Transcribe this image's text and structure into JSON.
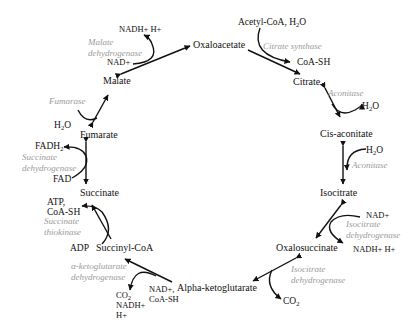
{
  "metabolites": {
    "oxaloacetate": "Oxaloacetate",
    "citrate": "Citrate",
    "cis_aconitate": "Cis-aconitate",
    "isocitrate": "Isocitrate",
    "oxalosuccinate": "Oxalosuccinate",
    "alpha_ketoglutarate": "Alpha-ketoglutarate",
    "succinyl_coa": "Succinyl-CoA",
    "succinate": "Succinate",
    "fumarate": "Fumarate",
    "malate": "Malate"
  },
  "enzymes": {
    "citrate_synthase": "Citrate synthase",
    "aconitase_1": "Aconitase",
    "aconitase_2": "Aconitase",
    "isocitrate_dh_1": [
      "Isocitrate",
      "dehydrogenase"
    ],
    "isocitrate_dh_2": [
      "Isocitrate",
      "dehydrogenase"
    ],
    "akg_dh": [
      "α-ketoglutarate",
      "dehydrogenase"
    ],
    "succinate_thiokinase": [
      "Succinate",
      "thiokinase"
    ],
    "succinate_dh": [
      "Succinate",
      "dehydrogenase"
    ],
    "fumarase": "Fumarase",
    "malate_dh": [
      "Malate",
      "dehydrogenase"
    ]
  },
  "cofactors": {
    "acetyl_coa_h2o": {
      "text": "Acetyl-CoA, H",
      "sub": "2",
      "tail": "O"
    },
    "coa_sh_citrate": "CoA-SH",
    "h2o_aconitase_out": {
      "text": "H",
      "sub": "2",
      "tail": "O"
    },
    "h2o_aconitase_in": {
      "text": "H",
      "sub": "2",
      "tail": "O"
    },
    "nad_isocitrate": "NAD+",
    "nadh_isocitrate": "NADH+ H+",
    "co2_oxalosuccinate": {
      "text": "CO",
      "sub": "2"
    },
    "nad_coash_akg": [
      "NAD+,",
      "CoA-SH"
    ],
    "co2_nadh_akg": {
      "co2": "CO",
      "sub": "2",
      "line2": "NADH+",
      "line3": "H+"
    },
    "adp": "ADP",
    "atp_coash": [
      "ATP,",
      "CoA-SH"
    ],
    "fad": "FAD",
    "fadh2": {
      "text": "FADH",
      "sub": "2"
    },
    "h2o_fumarase": {
      "text": "H",
      "sub": "2",
      "tail": "O"
    },
    "nad_malate": "NAD+",
    "nadh_malate": "NADH+ H+"
  },
  "colors": {
    "text": "#111111",
    "enzyme": "#9a9a9a",
    "arrow": "#111111",
    "background": "#ffffff"
  }
}
